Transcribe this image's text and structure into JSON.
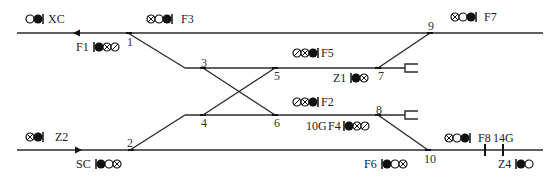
{
  "diagram": {
    "title": "",
    "colors": {
      "track": "#2a2a2a",
      "signal": "#111111",
      "background": "#ffffff"
    },
    "tracks": [
      {
        "id": "main-upper",
        "from": [
          17,
          33
        ],
        "to": [
          543,
          33
        ]
      },
      {
        "id": "main-lower",
        "from": [
          17,
          150
        ],
        "to": [
          543,
          150
        ]
      },
      {
        "id": "siding-upper",
        "from": [
          185,
          68
        ],
        "to": [
          405,
          68
        ]
      },
      {
        "id": "siding-lower",
        "from": [
          185,
          115
        ],
        "to": [
          405,
          115
        ]
      }
    ],
    "switch_numbers": [
      {
        "id": "1",
        "label": "1"
      },
      {
        "id": "2",
        "label": "2"
      },
      {
        "id": "3",
        "label": "3"
      },
      {
        "id": "4",
        "label": "4"
      },
      {
        "id": "5",
        "label": "5"
      },
      {
        "id": "6",
        "label": "6"
      },
      {
        "id": "7",
        "label": "7"
      },
      {
        "id": "8",
        "label": "8"
      },
      {
        "id": "9",
        "label": "9"
      },
      {
        "id": "10",
        "label": "10"
      }
    ],
    "signals": {
      "XC": {
        "label": "XC",
        "lamps": [
          "open",
          "filled",
          "mast"
        ]
      },
      "F3": {
        "label": "F3",
        "lamps": [
          "cross",
          "open",
          "filled",
          "mast"
        ]
      },
      "F1": {
        "label": "F1",
        "lamps": [
          "mast",
          "filled",
          "cross",
          "slash"
        ]
      },
      "F7": {
        "label": "F7",
        "lamps": [
          "cross",
          "open",
          "filled",
          "mast"
        ]
      },
      "F5": {
        "label": "F5",
        "lamps": [
          "slash",
          "cross",
          "filled",
          "mast"
        ]
      },
      "Z1": {
        "label": "Z1",
        "lamps": [
          "mast",
          "filled",
          "cross"
        ]
      },
      "F2": {
        "label": "F2",
        "lamps": [
          "slash",
          "cross",
          "filled",
          "mast"
        ]
      },
      "F4": {
        "label": "F4",
        "lamps": [
          "mast",
          "filled",
          "cross",
          "slash"
        ]
      },
      "Z2": {
        "label": "Z2",
        "lamps": [
          "cross",
          "filled",
          "mast"
        ]
      },
      "SC": {
        "label": "SC",
        "lamps": [
          "mast",
          "filled",
          "open",
          "cross"
        ]
      },
      "F6": {
        "label": "F6",
        "lamps": [
          "mast",
          "filled",
          "open",
          "cross"
        ]
      },
      "F8": {
        "label": "F8",
        "lamps": [
          "cross",
          "open",
          "filled",
          "mast"
        ]
      },
      "Z4": {
        "label": "Z4",
        "lamps": [
          "mast",
          "filled",
          "open"
        ]
      }
    },
    "section_labels": {
      "10G": "10G",
      "14G": "14G"
    },
    "arrows": [
      {
        "id": "upper-arrow",
        "direction": "left"
      },
      {
        "id": "lower-arrow",
        "direction": "right"
      }
    ]
  }
}
